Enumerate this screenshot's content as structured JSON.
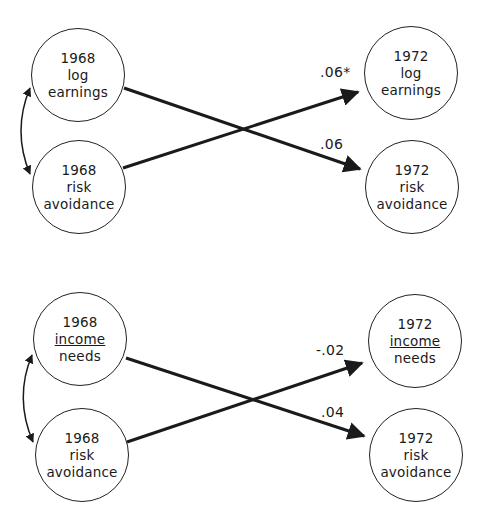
{
  "panels": [
    {
      "nodes": [
        {
          "year": "1968",
          "line1": "log",
          "line2": "earnings",
          "underline": false
        },
        {
          "year": "1968",
          "line1": "risk",
          "line2": "avoidance",
          "underline": false
        },
        {
          "year": "1972",
          "line1": "log",
          "line2": "earnings",
          "underline": false
        },
        {
          "year": "1972",
          "line1": "risk",
          "line2": "avoidance",
          "underline": false
        }
      ],
      "paths": [
        {
          "from": "1968 risk avoidance",
          "to": "1972 log earnings",
          "coef": ".06*"
        },
        {
          "from": "1968 log earnings",
          "to": "1972 risk avoidance",
          "coef": ".06"
        }
      ]
    },
    {
      "nodes": [
        {
          "year": "1968",
          "line1": "income",
          "line2": "needs",
          "underline": true
        },
        {
          "year": "1968",
          "line1": "risk",
          "line2": "avoidance",
          "underline": false
        },
        {
          "year": "1972",
          "line1": "income",
          "line2": "needs",
          "underline": true
        },
        {
          "year": "1972",
          "line1": "risk",
          "line2": "avoidance",
          "underline": false
        }
      ],
      "paths": [
        {
          "from": "1968 risk avoidance",
          "to": "1972 income needs",
          "coef": "-.02"
        },
        {
          "from": "1968 income needs",
          "to": "1972 risk avoidance",
          "coef": ".04"
        }
      ]
    }
  ]
}
